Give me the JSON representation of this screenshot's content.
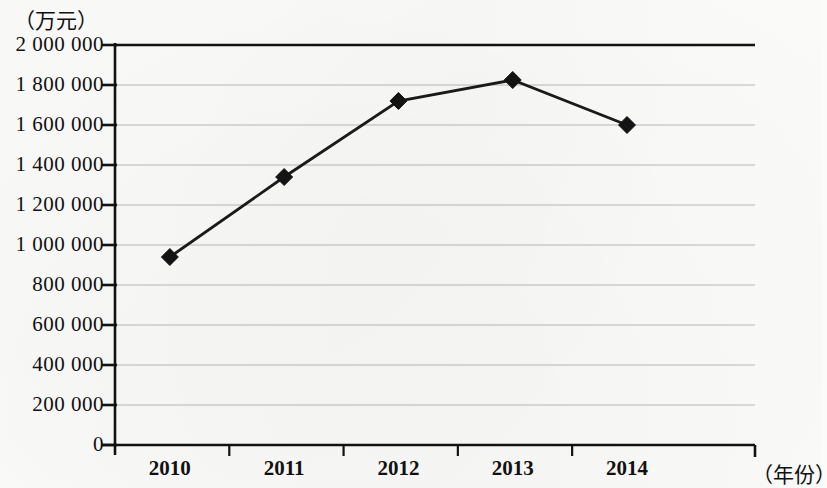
{
  "chart_data": {
    "type": "line",
    "title": "",
    "subtitle": "",
    "xlabel": "（年份）",
    "ylabel": "（万元）",
    "categories": [
      "2010",
      "2011",
      "2012",
      "2013",
      "2014"
    ],
    "values": [
      940000,
      1340000,
      1720000,
      1825000,
      1600000
    ],
    "series": [
      {
        "name": "",
        "values": [
          940000,
          1340000,
          1720000,
          1825000,
          1600000
        ]
      }
    ],
    "ylim": [
      0,
      2000000
    ],
    "ytick_values": [
      0,
      200000,
      400000,
      600000,
      800000,
      1000000,
      1200000,
      1400000,
      1600000,
      1800000,
      2000000
    ],
    "ytick_labels": [
      "0",
      "200 000",
      "400 000",
      "600 000",
      "800 000",
      "1 000 000",
      "1 200 000",
      "1 400 000",
      "1 600 000",
      "1 800 000",
      "2 000 000"
    ],
    "xtick_labels": [
      "2010",
      "2011",
      "2012",
      "2013",
      "2014"
    ],
    "grid": true,
    "grid_color": "#b9b9b9",
    "legend": null,
    "legend_position": "none",
    "marker": "diamond",
    "marker_color": "#141414",
    "line_color": "#1a1a1a",
    "axis_color": "#121212",
    "background_color": "#fbfbf9"
  },
  "axis": {
    "y_unit_label": "（万元）",
    "x_unit_label": "（年份）"
  }
}
